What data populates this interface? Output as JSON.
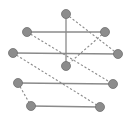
{
  "diagram": {
    "type": "graph",
    "colors": {
      "node": "#8c8c8c",
      "node_stroke": "#6e6e6e",
      "edge": "#8a8a8a",
      "background": "#ffffff"
    },
    "node_radius": 4.5,
    "nodes": [
      {
        "id": "A",
        "x": 66,
        "y": 14
      },
      {
        "id": "B",
        "x": 27,
        "y": 32
      },
      {
        "id": "C",
        "x": 105,
        "y": 32
      },
      {
        "id": "D",
        "x": 13,
        "y": 53
      },
      {
        "id": "E",
        "x": 118,
        "y": 54
      },
      {
        "id": "F",
        "x": 66,
        "y": 66
      },
      {
        "id": "G",
        "x": 18,
        "y": 83
      },
      {
        "id": "H",
        "x": 113,
        "y": 84
      },
      {
        "id": "I",
        "x": 31,
        "y": 106
      },
      {
        "id": "J",
        "x": 100,
        "y": 107
      }
    ],
    "edges": [
      {
        "from": "B",
        "to": "C",
        "style": "solid"
      },
      {
        "from": "D",
        "to": "E",
        "style": "solid"
      },
      {
        "from": "A",
        "to": "F",
        "style": "solid"
      },
      {
        "from": "G",
        "to": "H",
        "style": "solid"
      },
      {
        "from": "I",
        "to": "J",
        "style": "solid"
      },
      {
        "from": "A",
        "to": "E",
        "style": "dashed"
      },
      {
        "from": "B",
        "to": "H",
        "style": "dashed"
      },
      {
        "from": "C",
        "to": "F",
        "style": "dashed"
      },
      {
        "from": "D",
        "to": "J",
        "style": "dashed"
      },
      {
        "from": "G",
        "to": "I",
        "style": "dashed"
      }
    ]
  }
}
